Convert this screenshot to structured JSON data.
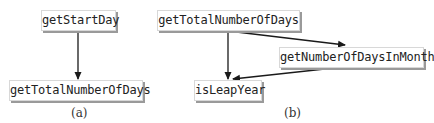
{
  "panels": [
    {
      "caption": "(a)",
      "nodes": [
        {
          "label": "getStartDay"
        },
        {
          "label": "getTotalNumberOfDays"
        }
      ],
      "edges": [
        {
          "from": "getStartDay",
          "to": "getTotalNumberOfDays"
        }
      ]
    },
    {
      "caption": "(b)",
      "nodes": [
        {
          "label": "getTotalNumberOfDays"
        },
        {
          "label": "getNumberOfDaysInMonth"
        },
        {
          "label": "isLeapYear"
        }
      ],
      "edges": [
        {
          "from": "getTotalNumberOfDays",
          "to": "isLeapYear"
        },
        {
          "from": "getTotalNumberOfDays",
          "to": "getNumberOfDaysInMonth"
        },
        {
          "from": "getNumberOfDaysInMonth",
          "to": "isLeapYear"
        }
      ]
    }
  ],
  "colors": {
    "line": "#1a1a1a",
    "node_border": "#d8d8d8",
    "node_shadow": "#9a9a9a",
    "text": "#222222"
  }
}
